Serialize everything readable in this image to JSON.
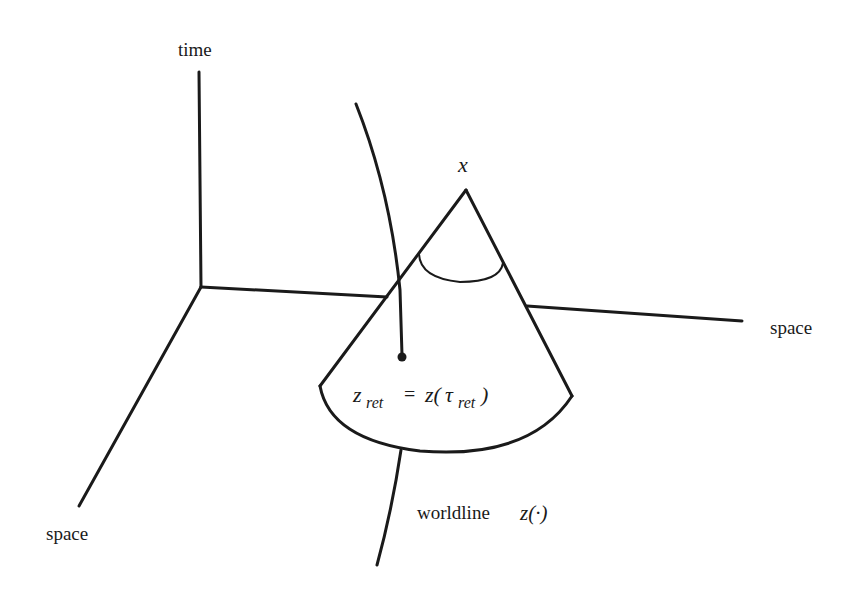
{
  "diagram": {
    "type": "spacetime-light-cone",
    "axes": {
      "vertical_label": "time",
      "right_label": "space",
      "front_label": "space"
    },
    "apex_label": "x",
    "retarded_point_label": {
      "lhs": "z",
      "lhs_sub": "ret",
      "equals": "=",
      "rhs_func": "z(",
      "rhs_var": "τ",
      "rhs_sub": "ret",
      "rhs_close": ")"
    },
    "worldline_label": {
      "text": "worldline",
      "symbol": "z(·)"
    },
    "colors": {
      "stroke": "#1a1a1a",
      "background": "#ffffff"
    }
  }
}
